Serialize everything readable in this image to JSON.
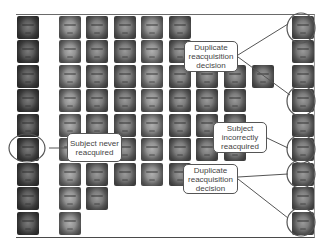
{
  "figure": {
    "grid": {
      "columns": [
        {
          "x": 17,
          "rows": [
            0,
            1,
            2,
            3,
            4,
            5,
            6,
            7,
            8
          ],
          "tone": "dark"
        },
        {
          "x": 59,
          "rows": [
            0,
            1,
            2,
            3,
            4,
            5,
            6,
            7,
            8
          ],
          "tone": "light"
        },
        {
          "x": 86,
          "rows": [
            0,
            1,
            2,
            3,
            4,
            5,
            6,
            7
          ],
          "tone": "mid"
        },
        {
          "x": 114,
          "rows": [
            0,
            1,
            2,
            3,
            4,
            5,
            6
          ],
          "tone": "mid"
        },
        {
          "x": 141,
          "rows": [
            0,
            1,
            2,
            3,
            4,
            5,
            6
          ],
          "tone": "light"
        },
        {
          "x": 169,
          "rows": [
            0,
            1,
            2,
            3,
            4,
            5,
            6
          ],
          "tone": "mid"
        },
        {
          "x": 196,
          "rows": [
            2,
            3,
            4,
            5
          ],
          "tone": "mid"
        },
        {
          "x": 224,
          "rows": [
            2,
            3,
            4,
            5
          ],
          "tone": "mid"
        },
        {
          "x": 252,
          "rows": [
            2
          ],
          "tone": "mid"
        },
        {
          "x": 292,
          "rows": [
            0,
            1,
            2,
            3,
            4,
            5,
            6,
            7,
            8
          ],
          "tone": "mid"
        }
      ],
      "row_y": [
        16,
        40,
        65,
        89,
        114,
        138,
        163,
        187,
        212
      ]
    },
    "annotations": [
      {
        "id": "dup-top",
        "text": "Duplicate reacquisition decision",
        "box": {
          "x": 184,
          "y": 41,
          "w": 54,
          "h": 31
        }
      },
      {
        "id": "never",
        "text": "Subject never reacquired",
        "box": {
          "x": 67,
          "y": 133,
          "w": 55,
          "h": 29
        }
      },
      {
        "id": "incorrect",
        "text": "Subject incorrectly reacquired",
        "box": {
          "x": 213,
          "y": 122,
          "w": 54,
          "h": 31
        }
      },
      {
        "id": "dup-bottom",
        "text": "Duplicate reacquisition decision",
        "box": {
          "x": 183,
          "y": 164,
          "w": 55,
          "h": 30
        }
      }
    ],
    "highlight_ellipses": [
      {
        "cx": 27,
        "cy": 148,
        "rx": 18,
        "ry": 14
      },
      {
        "cx": 301,
        "cy": 28,
        "rx": 14,
        "ry": 15
      },
      {
        "cx": 301,
        "cy": 101,
        "rx": 14,
        "ry": 15
      },
      {
        "cx": 301,
        "cy": 149,
        "rx": 14,
        "ry": 14
      },
      {
        "cx": 301,
        "cy": 174,
        "rx": 14,
        "ry": 14
      },
      {
        "cx": 301,
        "cy": 222,
        "rx": 14,
        "ry": 14
      }
    ],
    "connector_lines": [
      {
        "x1": 238,
        "y1": 55,
        "x2": 288,
        "y2": 24
      },
      {
        "x1": 238,
        "y1": 57,
        "x2": 290,
        "y2": 95
      },
      {
        "x1": 49,
        "y1": 148,
        "x2": 67,
        "y2": 148
      },
      {
        "x1": 267,
        "y1": 138,
        "x2": 288,
        "y2": 148
      },
      {
        "x1": 238,
        "y1": 177,
        "x2": 288,
        "y2": 174
      },
      {
        "x1": 238,
        "y1": 179,
        "x2": 288,
        "y2": 218
      }
    ],
    "colors": {
      "border": "#555555",
      "line": "#555555",
      "text": "#444444",
      "background": "#ffffff"
    }
  }
}
